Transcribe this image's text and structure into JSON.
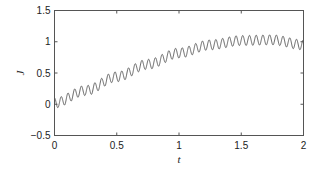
{
  "chart_data": {
    "type": "line",
    "title": "",
    "xlabel": "t",
    "ylabel": "J",
    "xlim": [
      0,
      2
    ],
    "ylim": [
      -0.5,
      1.5
    ],
    "x_ticks": [
      0,
      0.5,
      1,
      1.5,
      2
    ],
    "x_tick_labels": [
      "0",
      "0.5",
      "1",
      "1.5",
      "2"
    ],
    "y_ticks": [
      -0.5,
      0,
      0.5,
      1,
      1.5
    ],
    "y_tick_labels": [
      "−0.5",
      "0",
      "0.5",
      "1",
      "1.5"
    ],
    "grid": false,
    "legend": null,
    "series": [
      {
        "name": "J(t)",
        "color": "#555555",
        "description": "Rising, saturating trend with superimposed fast oscillation (amplitude ~0.08, ~37 cycles over t in [0,2])",
        "trend_points": {
          "t": [
            0,
            0.25,
            0.5,
            0.75,
            1.0,
            1.25,
            1.5,
            1.75,
            2.0
          ],
          "J": [
            0.02,
            0.22,
            0.44,
            0.64,
            0.82,
            0.95,
            1.02,
            1.03,
            0.95
          ]
        },
        "oscillation": {
          "amplitude": 0.08,
          "period": 0.054
        }
      }
    ]
  },
  "colors": {
    "axes": "#555555",
    "line": "#555555",
    "background": "#ffffff"
  }
}
